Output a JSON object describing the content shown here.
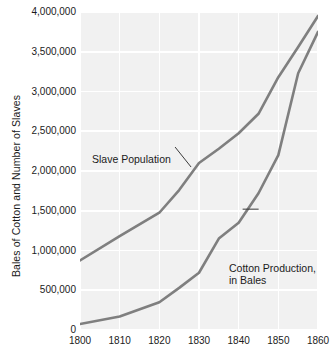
{
  "chart_data": {
    "type": "line",
    "title": "",
    "xlabel": "",
    "ylabel": "Bales of Cotton and Number of Slaves",
    "xlim": [
      1800,
      1860
    ],
    "ylim": [
      0,
      4000000
    ],
    "grid": true,
    "legend_position": "inline-annotations",
    "x_ticks": [
      "1800",
      "1810",
      "1820",
      "1830",
      "1840",
      "1850",
      "1860"
    ],
    "x_tick_values": [
      1800,
      1810,
      1820,
      1830,
      1840,
      1850,
      1860
    ],
    "y_ticks": [
      "0",
      "500,000",
      "1,000,000",
      "1,500,000",
      "2,000,000",
      "2,500,000",
      "3,000,000",
      "3,500,000",
      "4,000,000"
    ],
    "y_tick_values": [
      0,
      500000,
      1000000,
      1500000,
      2000000,
      2500000,
      3000000,
      3500000,
      4000000
    ],
    "x": [
      1800,
      1810,
      1820,
      1825,
      1830,
      1835,
      1840,
      1845,
      1850,
      1855,
      1860
    ],
    "series": [
      {
        "name": "Slave Population",
        "color": "#7f7f7f",
        "values": [
          875000,
          1180000,
          1475000,
          1760000,
          2100000,
          2280000,
          2475000,
          2720000,
          3180000,
          3560000,
          3950000
        ]
      },
      {
        "name": "Cotton Production, in Bales",
        "color": "#7f7f7f",
        "values": [
          75000,
          170000,
          350000,
          530000,
          720000,
          1150000,
          1350000,
          1720000,
          2200000,
          3230000,
          3750000
        ]
      }
    ],
    "annotations": [
      {
        "text": "Slave Population",
        "target_x": 1828,
        "target_y": 2050000
      },
      {
        "text_line1": "Cotton Production,",
        "text_line2": "in Bales",
        "target_x": 1843,
        "target_y": 1520000
      }
    ]
  },
  "axis": {
    "y_title": "Bales of Cotton and Number of Slaves"
  },
  "annotations": {
    "slave_population": "Slave Population",
    "cotton_production_line1": "Cotton Production,",
    "cotton_production_line2": "in Bales"
  },
  "colors": {
    "panel_background": "#f1f1f1",
    "gridline": "#ffffff",
    "line": "#7f7f7f",
    "text": "#1b1b1b",
    "page_background": "#ffffff"
  }
}
